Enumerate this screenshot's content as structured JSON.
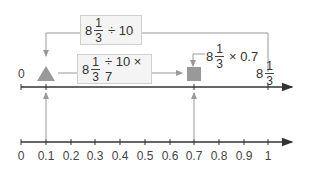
{
  "diagram": {
    "top_line": {
      "zero_label": "0",
      "end_label": {
        "whole": "8",
        "numerator": "1",
        "denominator": "3"
      }
    },
    "box_divide": {
      "whole": "8",
      "numerator": "1",
      "denominator": "3",
      "operation": "÷ 10"
    },
    "box_divide_multiply": {
      "whole": "8",
      "numerator": "1",
      "denominator": "3",
      "operation": "÷ 10 × 7"
    },
    "expr_multiply": {
      "whole": "8",
      "numerator": "1",
      "denominator": "3",
      "operation": "× 0.7"
    },
    "markers": [
      {
        "shape": "triangle",
        "position": "0.1",
        "color": "#999999"
      },
      {
        "shape": "square",
        "position": "0.7",
        "color": "#999999"
      }
    ],
    "bottom_line": {
      "ticks": [
        "0",
        "0.1",
        "0.2",
        "0.3",
        "0.4",
        "0.5",
        "0.6",
        "0.7",
        "0.8",
        "0.9",
        "1"
      ]
    },
    "colors": {
      "axis": "#333333",
      "connector": "#999999",
      "marker": "#999999",
      "box_fill": "#f4f4f4",
      "box_border": "#cfcfcf"
    }
  }
}
